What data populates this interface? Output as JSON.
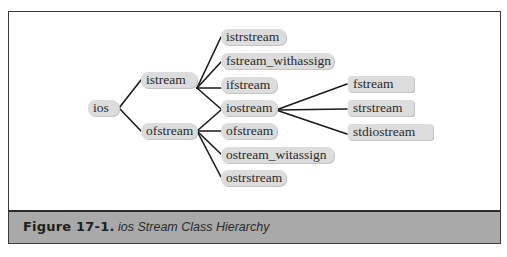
{
  "diagram": {
    "type": "class-hierarchy-tree",
    "root": "ios",
    "nodes": {
      "ios": "ios",
      "istream": "istream",
      "ofstream_l1": "ofstream",
      "istrstream": "istrstream",
      "fstream_withassign": "fstream_withassign",
      "ifstream": "ifstream",
      "iostream": "iostream",
      "ofstream_l2": "ofstream",
      "ostream_witassign": "ostream_witassign",
      "ostrstream": "ostrstream",
      "fstream": "fstream",
      "strstream": "strstream",
      "stdiostream": "stdiostream"
    },
    "edges": [
      [
        "ios",
        "istream"
      ],
      [
        "ios",
        "ofstream_l1"
      ],
      [
        "istream",
        "istrstream"
      ],
      [
        "istream",
        "fstream_withassign"
      ],
      [
        "istream",
        "ifstream"
      ],
      [
        "istream",
        "iostream"
      ],
      [
        "ofstream_l1",
        "iostream"
      ],
      [
        "ofstream_l1",
        "ofstream_l2"
      ],
      [
        "ofstream_l1",
        "ostream_witassign"
      ],
      [
        "ofstream_l1",
        "ostrstream"
      ],
      [
        "iostream",
        "fstream"
      ],
      [
        "iostream",
        "strstream"
      ],
      [
        "iostream",
        "stdiostream"
      ]
    ]
  },
  "caption": {
    "label": "Figure 17-1.",
    "title": "ios Stream Class Hierarchy"
  },
  "colors": {
    "node_fill": "#dcdcdc",
    "caption_band": "#a9a9a9",
    "frame_border": "#3a3a3a",
    "edge": "#1a1a1a"
  }
}
